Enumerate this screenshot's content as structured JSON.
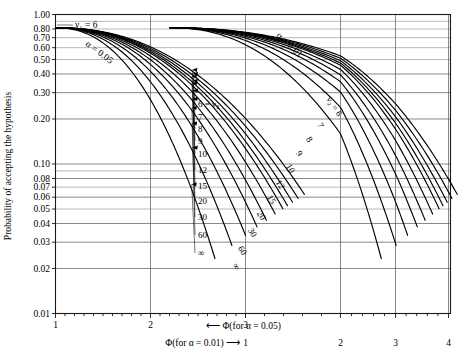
{
  "figure": {
    "y_axis_title": "Probability of accepting the hypothesis",
    "annotations": {
      "v1": "ν₁ = 6",
      "alpha_left": "α = 0.05",
      "alpha_right": "α = 0.01",
      "left_family_head": "6 = ν₂",
      "right_family_head": "ν₂ = 6",
      "axis_caption_left": "Φ(for α = 0.01)",
      "axis_caption_right": "Φ(for α = 0.05)",
      "arrow_left": "⟶",
      "arrow_right": "⟵"
    }
  },
  "chart_data": {
    "type": "line",
    "title": "",
    "subtitle": "",
    "xlabel_primary": "Φ(for α = 0.05)",
    "xlabel_secondary": "Φ(for α = 0.01)",
    "ylabel": "Probability of accepting the hypothesis",
    "yscale": "log",
    "ylim": [
      0.01,
      1.0
    ],
    "grid": true,
    "legend_position": "inline-labels",
    "y_ticks": [
      1.0,
      0.8,
      0.7,
      0.6,
      0.5,
      0.4,
      0.3,
      0.2,
      0.1,
      0.08,
      0.07,
      0.06,
      0.05,
      0.04,
      0.03,
      0.02,
      0.01
    ],
    "y_tick_labels": [
      "1.00",
      "0.80",
      "0.70",
      "0.60",
      "0.50",
      "0.40",
      "0.30",
      "0.20",
      "0.10",
      "0.08",
      "0.07",
      "0.06",
      "0.05",
      "0.04",
      "0.03",
      "0.02",
      "0.01"
    ],
    "x_axis_alpha005": {
      "label": "Φ(for α = 0.05)",
      "ticks": [
        1,
        2,
        3
      ],
      "tick_labels": [
        "1",
        "2",
        "3"
      ],
      "xlim": [
        1,
        3.42
      ]
    },
    "x_axis_alpha001": {
      "label": "Φ(for α = 0.01)",
      "ticks": [
        1,
        2,
        3,
        4
      ],
      "tick_labels": [
        "1",
        "2",
        "3",
        "4"
      ],
      "xlim": [
        0.205,
        4.16
      ]
    },
    "numerator_df": 6,
    "families": [
      {
        "name": "alpha = 0.05",
        "alpha": 0.05,
        "label": "α = 0.05",
        "curve_labels": [
          "6 = ν₂",
          "7",
          "8",
          "9",
          "10",
          "12",
          "15",
          "20",
          "30",
          "60",
          "∞"
        ],
        "denominator_df": [
          "6",
          "7",
          "8",
          "9",
          "10",
          "12",
          "15",
          "20",
          "30",
          "60",
          "∞"
        ]
      },
      {
        "name": "alpha = 0.01",
        "alpha": 0.01,
        "label": "α = 0.01",
        "curve_labels": [
          "ν₂ = 6",
          "7",
          "8",
          "9",
          "10",
          "12",
          "15",
          "20",
          "30",
          "60",
          "∞"
        ],
        "denominator_df": [
          "6",
          "7",
          "8",
          "9",
          "10",
          "12",
          "15",
          "20",
          "30",
          "60",
          "∞"
        ]
      }
    ]
  }
}
